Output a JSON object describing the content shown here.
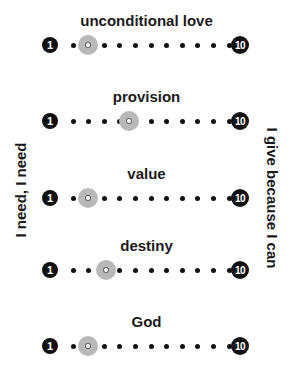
{
  "scale": {
    "min_label": "1",
    "max_label": "10",
    "positions": 10
  },
  "side_labels": {
    "left": "I need, I  need",
    "right": "I give because I can"
  },
  "rows": [
    {
      "label": "unconditional love",
      "marker_position": 2
    },
    {
      "label": "provision",
      "marker_position": 4
    },
    {
      "label": "value",
      "marker_position": 2
    },
    {
      "label": "destiny",
      "marker_position": 3
    },
    {
      "label": "God",
      "marker_position": 2
    }
  ],
  "colors": {
    "dot": "#111111",
    "marker": "#b8b8b8",
    "badge": "#111111"
  }
}
